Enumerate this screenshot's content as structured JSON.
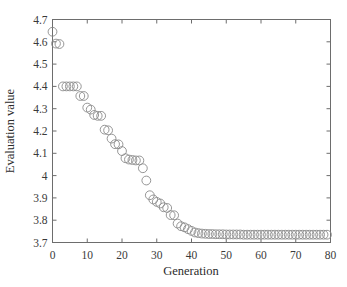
{
  "figure": {
    "background_color": "#ffffff",
    "axis_color": "#6d6d6d",
    "marker_color": "#8a8a8a"
  },
  "chart_data": {
    "type": "scatter",
    "title": "",
    "xlabel": "Generation",
    "ylabel": "Evaluation value",
    "xlim": [
      0,
      80
    ],
    "ylim": [
      3.7,
      4.7
    ],
    "xticks": [
      0,
      10,
      20,
      30,
      40,
      50,
      60,
      70,
      80
    ],
    "xtick_labels": [
      "0",
      "10",
      "20",
      "30",
      "40",
      "50",
      "60",
      "70",
      "80"
    ],
    "yticks": [
      3.7,
      3.8,
      3.9,
      4.0,
      4.1,
      4.2,
      4.3,
      4.4,
      4.5,
      4.6,
      4.7
    ],
    "ytick_labels": [
      "3.7",
      "3.8",
      "3.9",
      "4",
      "4.1",
      "4.2",
      "4.3",
      "4.4",
      "4.5",
      "4.6",
      "4.7"
    ],
    "grid": false,
    "legend": null,
    "marker": "open-circle",
    "marker_size": 4.4,
    "series": [
      {
        "name": "Evaluation value per generation",
        "x": [
          0,
          1,
          2,
          3,
          4,
          5,
          6,
          7,
          8,
          9,
          10,
          11,
          12,
          13,
          14,
          15,
          16,
          17,
          18,
          19,
          20,
          21,
          22,
          23,
          24,
          25,
          26,
          27,
          28,
          29,
          30,
          31,
          32,
          33,
          34,
          35,
          36,
          37,
          38,
          39,
          40,
          41,
          42,
          43,
          44,
          45,
          46,
          47,
          48,
          49,
          50,
          51,
          52,
          53,
          54,
          55,
          56,
          57,
          58,
          59,
          60,
          61,
          62,
          63,
          64,
          65,
          66,
          67,
          68,
          69,
          70,
          71,
          72,
          73,
          74,
          75,
          76,
          77,
          78,
          79
        ],
        "y": [
          4.645,
          4.592,
          4.59,
          4.4,
          4.4,
          4.4,
          4.4,
          4.4,
          4.357,
          4.357,
          4.305,
          4.296,
          4.272,
          4.268,
          4.268,
          4.206,
          4.203,
          4.166,
          4.141,
          4.14,
          4.11,
          4.078,
          4.072,
          4.07,
          4.068,
          4.068,
          4.033,
          3.978,
          3.912,
          3.893,
          3.882,
          3.875,
          3.858,
          3.855,
          3.823,
          3.822,
          3.785,
          3.773,
          3.768,
          3.76,
          3.752,
          3.745,
          3.742,
          3.74,
          3.739,
          3.738,
          3.738,
          3.737,
          3.737,
          3.737,
          3.736,
          3.736,
          3.736,
          3.736,
          3.736,
          3.735,
          3.735,
          3.735,
          3.735,
          3.735,
          3.735,
          3.735,
          3.735,
          3.735,
          3.735,
          3.735,
          3.735,
          3.735,
          3.735,
          3.735,
          3.735,
          3.735,
          3.735,
          3.735,
          3.735,
          3.735,
          3.735,
          3.735,
          3.735,
          3.735
        ]
      }
    ]
  }
}
